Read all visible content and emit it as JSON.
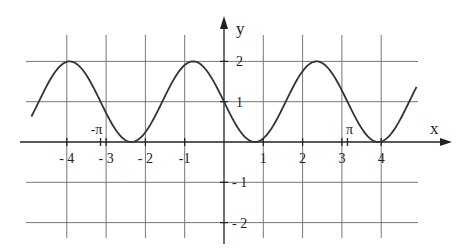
{
  "chart_data": {
    "type": "line",
    "title": "",
    "function": "y = 1 - sin(2x)",
    "xlabel": "x",
    "ylabel": "y",
    "xlim": [
      -4.9,
      4.9
    ],
    "ylim": [
      -2.4,
      2.4
    ],
    "grid": true,
    "x_ticks": [
      {
        "value": -4,
        "label": "-4"
      },
      {
        "value": -3,
        "label": "-3"
      },
      {
        "value": -2,
        "label": "-2"
      },
      {
        "value": -1,
        "label": "-1"
      },
      {
        "value": 1,
        "label": "1"
      },
      {
        "value": 2,
        "label": "2"
      },
      {
        "value": 3,
        "label": "3"
      },
      {
        "value": 4,
        "label": "4"
      }
    ],
    "y_ticks": [
      {
        "value": 2,
        "label": "2"
      },
      {
        "value": 1,
        "label": "1"
      },
      {
        "value": -1,
        "label": "-1"
      },
      {
        "value": -2,
        "label": "-2"
      }
    ],
    "annotations": [
      {
        "value": -3.14159,
        "label": "-π"
      },
      {
        "value": 3.14159,
        "label": "π"
      }
    ],
    "series": [
      {
        "name": "y = 1 - sin(2x)",
        "x_range": [
          -4.9,
          4.9
        ],
        "key_points": [
          {
            "x": -3.93,
            "y": 2
          },
          {
            "x": -2.36,
            "y": 0
          },
          {
            "x": -0.785,
            "y": 2
          },
          {
            "x": 0,
            "y": 1
          },
          {
            "x": 0.785,
            "y": 0
          },
          {
            "x": 2.36,
            "y": 2
          },
          {
            "x": 3.93,
            "y": 0
          }
        ]
      }
    ]
  }
}
